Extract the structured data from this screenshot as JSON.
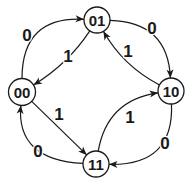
{
  "diagram": {
    "type": "state-transition-diagram",
    "colors": {
      "background": "#ffffff",
      "stroke": "#1a1a1a",
      "text": "#1a1a1a",
      "node_fill": "#ffffff"
    },
    "nodes": [
      {
        "id": "00",
        "label": "00",
        "x": 22,
        "y": 92,
        "r": 13.5
      },
      {
        "id": "01",
        "label": "01",
        "x": 97,
        "y": 20,
        "r": 13
      },
      {
        "id": "10",
        "label": "10",
        "x": 171,
        "y": 91,
        "r": 13
      },
      {
        "id": "11",
        "label": "11",
        "x": 96,
        "y": 164,
        "r": 13
      }
    ],
    "edges": [
      {
        "from": "00",
        "to": "01",
        "label": "0",
        "control": [
          22,
          16
        ],
        "label_pos": [
          27,
          35
        ]
      },
      {
        "from": "01",
        "to": "10",
        "label": "0",
        "control": [
          168,
          22
        ],
        "label_pos": [
          152,
          28
        ]
      },
      {
        "from": "10",
        "to": "11",
        "label": "0",
        "control": [
          174,
          166
        ],
        "label_pos": [
          165,
          143
        ]
      },
      {
        "from": "11",
        "to": "00",
        "label": "0",
        "control": [
          16,
          160
        ],
        "label_pos": [
          38,
          151
        ]
      },
      {
        "from": "01",
        "to": "00",
        "label": "1",
        "control": [
          68,
          64
        ],
        "label_pos": [
          68,
          56
        ]
      },
      {
        "from": "10",
        "to": "01",
        "label": "1",
        "control": [
          123,
          66
        ],
        "label_pos": [
          128,
          51
        ]
      },
      {
        "from": "00",
        "to": "11",
        "label": "1",
        "control": [
          57,
          126
        ],
        "label_pos": [
          59,
          114
        ]
      },
      {
        "from": "11",
        "to": "10",
        "label": "1",
        "control": [
          107,
          100
        ],
        "label_pos": [
          130,
          117
        ]
      }
    ]
  }
}
